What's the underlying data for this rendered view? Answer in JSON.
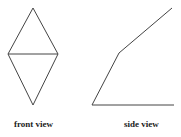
{
  "figures": [
    {
      "label": "front view",
      "shape": "rhombus-with-horizontal-diagonal",
      "points": {
        "top": [
          33,
          8
        ],
        "left": [
          8,
          54
        ],
        "right": [
          58,
          54
        ],
        "bottom": [
          33,
          105
        ]
      }
    },
    {
      "label": "side view",
      "shape": "bent-line-with-baseline",
      "points": {
        "base_left": [
          92,
          105
        ],
        "bend": [
          119,
          53
        ],
        "top_right": [
          172,
          8
        ],
        "base_right": [
          174,
          105
        ]
      }
    }
  ],
  "stroke_color": "#444444"
}
